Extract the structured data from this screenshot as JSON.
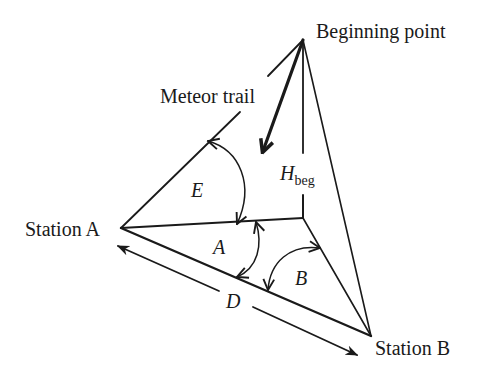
{
  "diagram": {
    "colors": {
      "line": "#1a1a1a",
      "background": "#ffffff"
    },
    "labels": {
      "beginning_point": "Beginning point",
      "meteor_trail": "Meteor trail",
      "station_a": "Station A",
      "station_b": "Station B",
      "height_main": "H",
      "height_sub": "beg",
      "angle_e": "E",
      "angle_a": "A",
      "angle_b": "B",
      "distance_d": "D"
    },
    "points": {
      "beginning_point": [
        303,
        40
      ],
      "station_a": [
        121,
        228
      ],
      "station_b": [
        371,
        336
      ],
      "height_foot": [
        303,
        218
      ]
    }
  }
}
